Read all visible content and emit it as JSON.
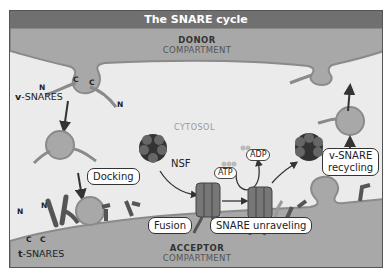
{
  "title": "The SNARE cycle",
  "compartments": {
    "donor": {
      "title": "DONOR",
      "subtitle": "COMPARTMENT"
    },
    "acceptor": {
      "title": "ACCEPTOR",
      "subtitle": "COMPARTMENT"
    },
    "cytosol": "CYTOSOL"
  },
  "labels": {
    "v_snares_prefix": "v",
    "v_snares_suffix": "-SNARES",
    "t_snares_prefix": "t",
    "t_snares_suffix": "-SNARES",
    "n": "N",
    "c": "C",
    "nsf": "NSF",
    "atp": "ATP",
    "adp": "ADP"
  },
  "steps": {
    "docking": "Docking",
    "fusion": "Fusion",
    "unraveling": "SNARE unraveling",
    "recycling_line1": "v-SNARE",
    "recycling_line2": "recycling"
  },
  "colors": {
    "header": "#707070",
    "compartment": "#a8a8a8",
    "cytosol": "#ebebeb",
    "membrane": "#8a8a8a",
    "snare": "#555555"
  }
}
